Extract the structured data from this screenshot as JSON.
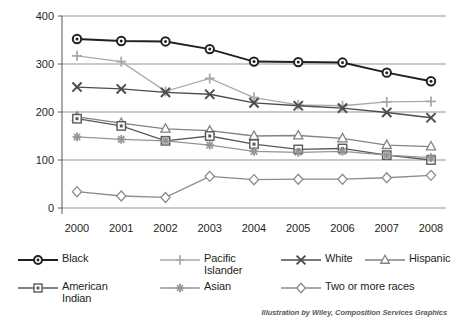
{
  "chart_data": {
    "type": "line",
    "title": "",
    "xlabel": "",
    "ylabel": "Death rate due to heart disease",
    "categories": [
      "2000",
      "2001",
      "2002",
      "2003",
      "2004",
      "2005",
      "2006",
      "2007",
      "2008"
    ],
    "x": [
      2000,
      2001,
      2002,
      2003,
      2004,
      2005,
      2006,
      2007,
      2008
    ],
    "ylim": [
      0,
      400
    ],
    "yticks": [
      0,
      100,
      200,
      300,
      400
    ],
    "ytick_labels": [
      "0",
      "100",
      "200",
      "300",
      "400"
    ],
    "grid": true,
    "legend_position": "bottom",
    "series": [
      {
        "name": "Black",
        "marker": "circle",
        "color": "#231f20",
        "values": [
          352,
          348,
          347,
          331,
          305,
          304,
          303,
          282,
          264
        ]
      },
      {
        "name": "Pacific Islander",
        "marker": "plus",
        "color": "#a7a9ac",
        "values": [
          317,
          305,
          243,
          270,
          230,
          215,
          213,
          221,
          222
        ]
      },
      {
        "name": "White",
        "marker": "x",
        "color": "#4d4d4f",
        "values": [
          252,
          248,
          241,
          237,
          219,
          213,
          208,
          199,
          188
        ]
      },
      {
        "name": "Hispanic",
        "marker": "triangle",
        "color": "#808285",
        "values": [
          190,
          177,
          165,
          161,
          150,
          151,
          145,
          131,
          128
        ]
      },
      {
        "name": "American Indian",
        "marker": "square",
        "color": "#58595b",
        "values": [
          186,
          171,
          140,
          150,
          133,
          122,
          124,
          110,
          100
        ]
      },
      {
        "name": "Asian",
        "marker": "asterisk",
        "color": "#939598",
        "values": [
          148,
          143,
          140,
          131,
          118,
          116,
          118,
          110,
          105
        ]
      },
      {
        "name": "Two or more races",
        "marker": "diamond",
        "color": "#8c8c8e",
        "values": [
          34,
          25,
          22,
          66,
          59,
          60,
          60,
          63,
          68
        ]
      }
    ]
  },
  "axis": {
    "y_title": "Death rate due to heart disease"
  },
  "legend": {
    "items": [
      {
        "label": "Black",
        "marker": "circle",
        "color": "#231f20"
      },
      {
        "label": "Pacific\nIslander",
        "marker": "plus",
        "color": "#a7a9ac"
      },
      {
        "label": "White",
        "marker": "x",
        "color": "#4d4d4f"
      },
      {
        "label": "Hispanic",
        "marker": "triangle",
        "color": "#808285"
      },
      {
        "label": "American\nIndian",
        "marker": "square",
        "color": "#58595b"
      },
      {
        "label": "Asian",
        "marker": "asterisk",
        "color": "#939598"
      },
      {
        "label": "Two or more races",
        "marker": "diamond",
        "color": "#8c8c8e"
      }
    ]
  },
  "credit": {
    "text": "Illustration by Wiley, Composition Services Graphics"
  }
}
